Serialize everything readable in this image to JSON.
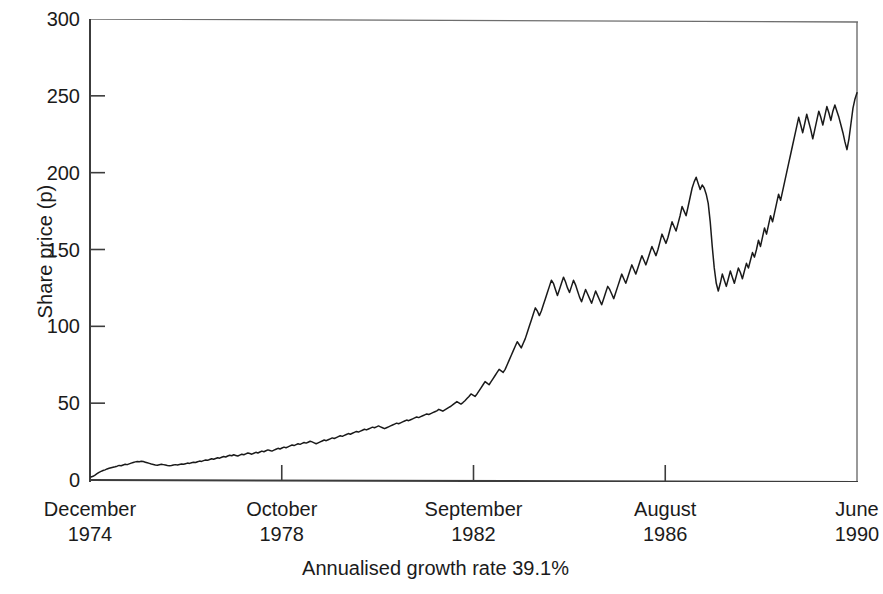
{
  "chart_data": {
    "type": "line",
    "title": "",
    "subtitle": "",
    "xlabel": "Annualised growth rate 39.1%",
    "ylabel": "Share price (p)",
    "ylim": [
      0,
      300
    ],
    "yticks": [
      0,
      50,
      100,
      150,
      200,
      250,
      300
    ],
    "ytick_labels": [
      "0",
      "50",
      "100",
      "150",
      "200",
      "250",
      "300"
    ],
    "grid": false,
    "legend": null,
    "legend_position": "none",
    "xtick_labels": [
      {
        "month": "December",
        "year": "1974"
      },
      {
        "month": "October",
        "year": "1978"
      },
      {
        "month": "September",
        "year": "1982"
      },
      {
        "month": "August",
        "year": "1986"
      },
      {
        "month": "June",
        "year": "1990"
      }
    ],
    "xlim_dates": [
      "December 1974",
      "June 1990"
    ],
    "annotation": "Annualised growth rate 39.1%",
    "line_color": "#1a1a1a",
    "axis_color": "#4a4a4a",
    "series": [
      {
        "name": "Share price",
        "units": "p",
        "x_start_label": "December 1974",
        "x_end_label": "June 1990",
        "values": [
          2,
          2.4,
          3.2,
          4.1,
          5.0,
          5.6,
          6.2,
          6.6,
          7.2,
          7.6,
          8.0,
          8.3,
          8.6,
          9.0,
          9.5,
          9.3,
          9.8,
          10.2,
          10.0,
          10.5,
          11.0,
          11.4,
          11.8,
          12.1,
          11.9,
          12.2,
          12.0,
          11.6,
          11.2,
          10.8,
          10.4,
          10.1,
          9.8,
          9.6,
          9.9,
          10.2,
          10.0,
          9.7,
          9.4,
          9.2,
          9.4,
          9.7,
          10.0,
          9.8,
          10.1,
          10.4,
          10.2,
          10.6,
          11.0,
          10.8,
          11.2,
          11.6,
          11.4,
          11.9,
          12.3,
          12.1,
          12.6,
          13.0,
          12.8,
          13.3,
          13.8,
          13.5,
          14.0,
          14.5,
          14.2,
          14.8,
          15.3,
          15.0,
          15.6,
          16.1,
          15.8,
          16.4,
          16.0,
          15.6,
          16.2,
          16.8,
          16.4,
          17.0,
          17.6,
          17.2,
          16.8,
          17.4,
          18.0,
          17.6,
          18.2,
          18.8,
          18.4,
          19.0,
          19.6,
          19.2,
          18.8,
          19.4,
          20.0,
          20.6,
          20.2,
          20.8,
          21.4,
          21.0,
          21.6,
          22.2,
          22.8,
          22.4,
          23.0,
          23.6,
          23.2,
          23.8,
          24.4,
          24.0,
          24.6,
          25.2,
          24.8,
          24.2,
          23.6,
          24.2,
          24.8,
          25.4,
          26.0,
          25.6,
          26.2,
          26.8,
          27.4,
          27.0,
          27.6,
          28.2,
          28.8,
          28.4,
          29.0,
          29.6,
          30.2,
          29.8,
          30.4,
          31.0,
          31.6,
          31.2,
          31.8,
          32.4,
          33.0,
          32.6,
          33.2,
          33.8,
          34.4,
          34.0,
          34.6,
          35.2,
          34.6,
          34.0,
          33.4,
          34.0,
          34.6,
          35.2,
          35.8,
          36.4,
          37.0,
          36.6,
          37.2,
          37.8,
          38.4,
          39.0,
          38.6,
          39.2,
          39.8,
          40.4,
          41.0,
          40.6,
          41.2,
          41.8,
          42.4,
          43.0,
          42.6,
          43.2,
          43.8,
          44.4,
          45.0,
          46.0,
          45.4,
          44.8,
          45.6,
          46.4,
          47.2,
          48.0,
          49.0,
          50.0,
          51.0,
          50.2,
          49.4,
          50.4,
          51.6,
          53.0,
          54.4,
          56.0,
          55.2,
          54.4,
          56.0,
          58.0,
          60.0,
          62.0,
          64.0,
          63.0,
          62.0,
          64.0,
          66.0,
          68.0,
          70.0,
          72.0,
          71.0,
          70.0,
          72.0,
          75.0,
          78.0,
          81.0,
          84.0,
          87.0,
          90.0,
          88.0,
          86.0,
          89.0,
          92.0,
          96.0,
          100.0,
          104.0,
          108.0,
          112.0,
          110.0,
          107.0,
          110.0,
          114.0,
          118.0,
          122.0,
          126.0,
          130.0,
          128.0,
          124.0,
          120.0,
          124.0,
          128.0,
          132.0,
          129.0,
          125.0,
          122.0,
          126.0,
          130.0,
          127.0,
          123.0,
          119.0,
          116.0,
          120.0,
          124.0,
          121.0,
          118.0,
          115.0,
          119.0,
          123.0,
          120.0,
          117.0,
          114.0,
          118.0,
          122.0,
          126.0,
          124.0,
          121.0,
          118.0,
          122.0,
          126.0,
          130.0,
          134.0,
          131.0,
          128.0,
          132.0,
          136.0,
          140.0,
          137.0,
          134.0,
          138.0,
          142.0,
          146.0,
          143.0,
          140.0,
          144.0,
          148.0,
          152.0,
          149.0,
          146.0,
          150.0,
          155.0,
          160.0,
          157.0,
          154.0,
          158.0,
          163.0,
          168.0,
          165.0,
          162.0,
          167.0,
          172.0,
          178.0,
          175.0,
          172.0,
          178.0,
          184.0,
          190.0,
          194.0,
          197.0,
          193.0,
          189.0,
          192.0,
          190.0,
          186.0,
          180.0,
          168.0,
          152.0,
          138.0,
          128.0,
          123.0,
          128.0,
          134.0,
          130.0,
          126.0,
          131.0,
          136.0,
          132.0,
          128.0,
          133.0,
          138.0,
          135.0,
          131.0,
          136.0,
          141.0,
          138.0,
          143.0,
          148.0,
          145.0,
          150.0,
          156.0,
          152.0,
          158.0,
          164.0,
          160.0,
          166.0,
          172.0,
          168.0,
          174.0,
          180.0,
          186.0,
          182.0,
          188.0,
          194.0,
          200.0,
          206.0,
          212.0,
          218.0,
          224.0,
          230.0,
          236.0,
          231.0,
          226.0,
          232.0,
          238.0,
          233.0,
          228.0,
          222.0,
          228.0,
          234.0,
          240.0,
          236.0,
          231.0,
          237.0,
          243.0,
          239.0,
          234.0,
          240.0,
          244.0,
          240.0,
          236.0,
          231.0,
          226.0,
          220.0,
          215.0,
          222.0,
          232.0,
          242.0,
          248.0,
          252.0
        ]
      }
    ]
  }
}
